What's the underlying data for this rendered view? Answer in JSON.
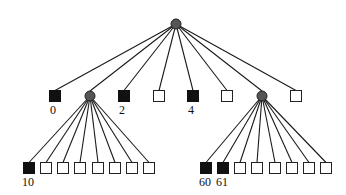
{
  "diagram": {
    "type": "tree",
    "colors": {
      "filled_node": "#111111",
      "empty_node": "#ffffff",
      "internal_node": "#555555",
      "edge": "#1a1a1a"
    },
    "root": {
      "id": "root",
      "shape": "circle",
      "x": 176,
      "y": 24
    },
    "level1": [
      {
        "id": "n0",
        "shape": "square",
        "filled": true,
        "x": 55,
        "y": 96,
        "label": "0"
      },
      {
        "id": "n1",
        "shape": "circle",
        "x": 90,
        "y": 96,
        "label": ""
      },
      {
        "id": "n2",
        "shape": "square",
        "filled": true,
        "x": 124,
        "y": 96,
        "label": "2"
      },
      {
        "id": "n3",
        "shape": "square",
        "filled": false,
        "x": 159,
        "y": 96,
        "label": ""
      },
      {
        "id": "n4",
        "shape": "square",
        "filled": true,
        "x": 193,
        "y": 96,
        "label": "4"
      },
      {
        "id": "n5",
        "shape": "square",
        "filled": false,
        "x": 227,
        "y": 96,
        "label": ""
      },
      {
        "id": "n6",
        "shape": "circle",
        "x": 262,
        "y": 96,
        "label": ""
      },
      {
        "id": "n7",
        "shape": "square",
        "filled": false,
        "x": 296,
        "y": 96,
        "label": ""
      }
    ],
    "level2_left": {
      "parent": "n1",
      "children": [
        {
          "filled": true,
          "x": 29,
          "label": "10"
        },
        {
          "filled": false,
          "x": 46,
          "label": ""
        },
        {
          "filled": false,
          "x": 63,
          "label": ""
        },
        {
          "filled": false,
          "x": 80,
          "label": ""
        },
        {
          "filled": false,
          "x": 98,
          "label": ""
        },
        {
          "filled": false,
          "x": 115,
          "label": ""
        },
        {
          "filled": false,
          "x": 132,
          "label": ""
        },
        {
          "filled": false,
          "x": 149,
          "label": ""
        }
      ],
      "y": 168
    },
    "level2_right": {
      "parent": "n6",
      "children": [
        {
          "filled": true,
          "x": 206,
          "label": "60"
        },
        {
          "filled": true,
          "x": 223,
          "label": "61"
        },
        {
          "filled": false,
          "x": 240,
          "label": ""
        },
        {
          "filled": false,
          "x": 257,
          "label": ""
        },
        {
          "filled": false,
          "x": 275,
          "label": ""
        },
        {
          "filled": false,
          "x": 292,
          "label": ""
        },
        {
          "filled": false,
          "x": 309,
          "label": ""
        },
        {
          "filled": false,
          "x": 326,
          "label": ""
        }
      ],
      "y": 168
    },
    "labels": {
      "n0": "0",
      "n2": "2",
      "n4": "4",
      "left_first": "10",
      "right_first": "60",
      "right_second": "61"
    }
  }
}
